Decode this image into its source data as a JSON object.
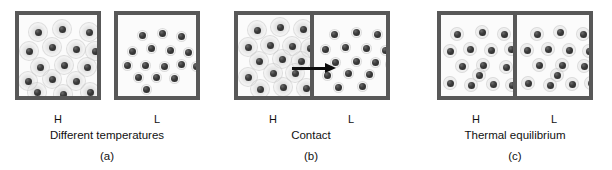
{
  "figure": {
    "background_color": "#ffffff",
    "border_color": "#585858",
    "particle_color": "#2b2b2b",
    "arrow_color": "#0d0d0d"
  },
  "panels": [
    {
      "id": "a",
      "letter": "(a)",
      "caption": "Different temperatures",
      "has_arrow": false,
      "boxes": [
        {
          "side": "left",
          "label": "H",
          "state": "hot",
          "particle_count": 16,
          "particles": [
            {
              "x": 19,
              "y": 17,
              "halo": "hot"
            },
            {
              "x": 43,
              "y": 14,
              "halo": "hot"
            },
            {
              "x": 70,
              "y": 17,
              "halo": "hot"
            },
            {
              "x": 10,
              "y": 36,
              "halo": "hot"
            },
            {
              "x": 33,
              "y": 32,
              "halo": "hot"
            },
            {
              "x": 57,
              "y": 34,
              "halo": "hot"
            },
            {
              "x": 76,
              "y": 36,
              "halo": "hot"
            },
            {
              "x": 21,
              "y": 52,
              "halo": "hot"
            },
            {
              "x": 45,
              "y": 50,
              "halo": "hot"
            },
            {
              "x": 68,
              "y": 52,
              "halo": "hot"
            },
            {
              "x": 9,
              "y": 66,
              "halo": "hot"
            },
            {
              "x": 33,
              "y": 64,
              "halo": "hot"
            },
            {
              "x": 57,
              "y": 66,
              "halo": "hot"
            },
            {
              "x": 18,
              "y": 77,
              "halo": "hot"
            },
            {
              "x": 44,
              "y": 79,
              "halo": "hot"
            },
            {
              "x": 71,
              "y": 77,
              "halo": "hot"
            }
          ]
        },
        {
          "side": "right",
          "label": "L",
          "state": "cold",
          "particle_count": 16,
          "particles": [
            {
              "x": 24,
              "y": 20,
              "halo": "cold"
            },
            {
              "x": 44,
              "y": 18,
              "halo": "cold"
            },
            {
              "x": 63,
              "y": 21,
              "halo": "cold"
            },
            {
              "x": 14,
              "y": 36,
              "halo": "cold"
            },
            {
              "x": 33,
              "y": 33,
              "halo": "cold"
            },
            {
              "x": 52,
              "y": 35,
              "halo": "cold"
            },
            {
              "x": 70,
              "y": 37,
              "halo": "cold"
            },
            {
              "x": 9,
              "y": 50,
              "halo": "cold"
            },
            {
              "x": 27,
              "y": 50,
              "halo": "cold"
            },
            {
              "x": 46,
              "y": 51,
              "halo": "cold"
            },
            {
              "x": 63,
              "y": 49,
              "halo": "cold"
            },
            {
              "x": 78,
              "y": 51,
              "halo": "cold"
            },
            {
              "x": 20,
              "y": 62,
              "halo": "cold"
            },
            {
              "x": 38,
              "y": 62,
              "halo": "cold"
            },
            {
              "x": 56,
              "y": 63,
              "halo": "cold"
            },
            {
              "x": 28,
              "y": 74,
              "halo": "cold"
            }
          ]
        }
      ]
    },
    {
      "id": "b",
      "letter": "(b)",
      "caption": "Contact",
      "has_arrow": true,
      "arrow_direction": "right",
      "boxes": [
        {
          "side": "left",
          "label": "H",
          "state": "hot",
          "particle_count": 16,
          "particles": [
            {
              "x": 19,
              "y": 15,
              "halo": "hot"
            },
            {
              "x": 42,
              "y": 12,
              "halo": "hot"
            },
            {
              "x": 65,
              "y": 14,
              "halo": "hot"
            },
            {
              "x": 10,
              "y": 32,
              "halo": "hot"
            },
            {
              "x": 32,
              "y": 30,
              "halo": "hot"
            },
            {
              "x": 54,
              "y": 31,
              "halo": "hot"
            },
            {
              "x": 72,
              "y": 33,
              "halo": "hot"
            },
            {
              "x": 21,
              "y": 46,
              "halo": "hot"
            },
            {
              "x": 44,
              "y": 44,
              "halo": "hot"
            },
            {
              "x": 63,
              "y": 46,
              "halo": "hot"
            },
            {
              "x": 35,
              "y": 58,
              "halo": "hot"
            },
            {
              "x": 57,
              "y": 58,
              "halo": "hot"
            },
            {
              "x": 10,
              "y": 62,
              "halo": "hot"
            },
            {
              "x": 22,
              "y": 74,
              "halo": "hot"
            },
            {
              "x": 45,
              "y": 72,
              "halo": "hot"
            },
            {
              "x": 68,
              "y": 73,
              "halo": "hot"
            }
          ]
        },
        {
          "side": "right",
          "label": "L",
          "state": "cool",
          "particle_count": 16,
          "particles": [
            {
              "x": 20,
              "y": 19,
              "halo": "cold"
            },
            {
              "x": 42,
              "y": 17,
              "halo": "cold"
            },
            {
              "x": 63,
              "y": 19,
              "halo": "cold"
            },
            {
              "x": 11,
              "y": 34,
              "halo": "cold"
            },
            {
              "x": 31,
              "y": 32,
              "halo": "cold"
            },
            {
              "x": 52,
              "y": 33,
              "halo": "cold"
            },
            {
              "x": 71,
              "y": 35,
              "halo": "cold"
            },
            {
              "x": 21,
              "y": 47,
              "halo": "cold"
            },
            {
              "x": 42,
              "y": 46,
              "halo": "cold"
            },
            {
              "x": 61,
              "y": 47,
              "halo": "cold"
            },
            {
              "x": 76,
              "y": 49,
              "halo": "cold"
            },
            {
              "x": 13,
              "y": 60,
              "halo": "cold"
            },
            {
              "x": 34,
              "y": 58,
              "halo": "cold"
            },
            {
              "x": 55,
              "y": 59,
              "halo": "cold"
            },
            {
              "x": 24,
              "y": 72,
              "halo": "cold"
            },
            {
              "x": 48,
              "y": 71,
              "halo": "cold"
            }
          ]
        }
      ]
    },
    {
      "id": "c",
      "letter": "(c)",
      "caption": "Thermal equilibrium",
      "has_arrow": false,
      "boxes": [
        {
          "side": "left",
          "label": "H",
          "state": "equilibrium",
          "particle_count": 15,
          "particles": [
            {
              "x": 16,
              "y": 19,
              "halo": "med"
            },
            {
              "x": 41,
              "y": 17,
              "halo": "med"
            },
            {
              "x": 63,
              "y": 19,
              "halo": "med"
            },
            {
              "x": 9,
              "y": 36,
              "halo": "med"
            },
            {
              "x": 29,
              "y": 34,
              "halo": "med"
            },
            {
              "x": 50,
              "y": 35,
              "halo": "med"
            },
            {
              "x": 70,
              "y": 34,
              "halo": "med"
            },
            {
              "x": 21,
              "y": 51,
              "halo": "med"
            },
            {
              "x": 42,
              "y": 50,
              "halo": "med"
            },
            {
              "x": 65,
              "y": 52,
              "halo": "med"
            },
            {
              "x": 9,
              "y": 68,
              "halo": "med"
            },
            {
              "x": 30,
              "y": 70,
              "halo": "med"
            },
            {
              "x": 52,
              "y": 69,
              "halo": "med"
            },
            {
              "x": 71,
              "y": 70,
              "halo": "med"
            },
            {
              "x": 38,
              "y": 60,
              "halo": "med"
            }
          ]
        },
        {
          "side": "right",
          "label": "L",
          "state": "equilibrium",
          "particle_count": 15,
          "particles": [
            {
              "x": 20,
              "y": 19,
              "halo": "med"
            },
            {
              "x": 43,
              "y": 17,
              "halo": "med"
            },
            {
              "x": 66,
              "y": 19,
              "halo": "med"
            },
            {
              "x": 10,
              "y": 35,
              "halo": "med"
            },
            {
              "x": 31,
              "y": 34,
              "halo": "med"
            },
            {
              "x": 52,
              "y": 35,
              "halo": "med"
            },
            {
              "x": 72,
              "y": 36,
              "halo": "med"
            },
            {
              "x": 22,
              "y": 50,
              "halo": "med"
            },
            {
              "x": 45,
              "y": 50,
              "halo": "med"
            },
            {
              "x": 67,
              "y": 51,
              "halo": "med"
            },
            {
              "x": 11,
              "y": 68,
              "halo": "med"
            },
            {
              "x": 33,
              "y": 70,
              "halo": "med"
            },
            {
              "x": 55,
              "y": 69,
              "halo": "med"
            },
            {
              "x": 74,
              "y": 68,
              "halo": "med"
            },
            {
              "x": 40,
              "y": 60,
              "halo": "med"
            }
          ]
        }
      ]
    }
  ]
}
